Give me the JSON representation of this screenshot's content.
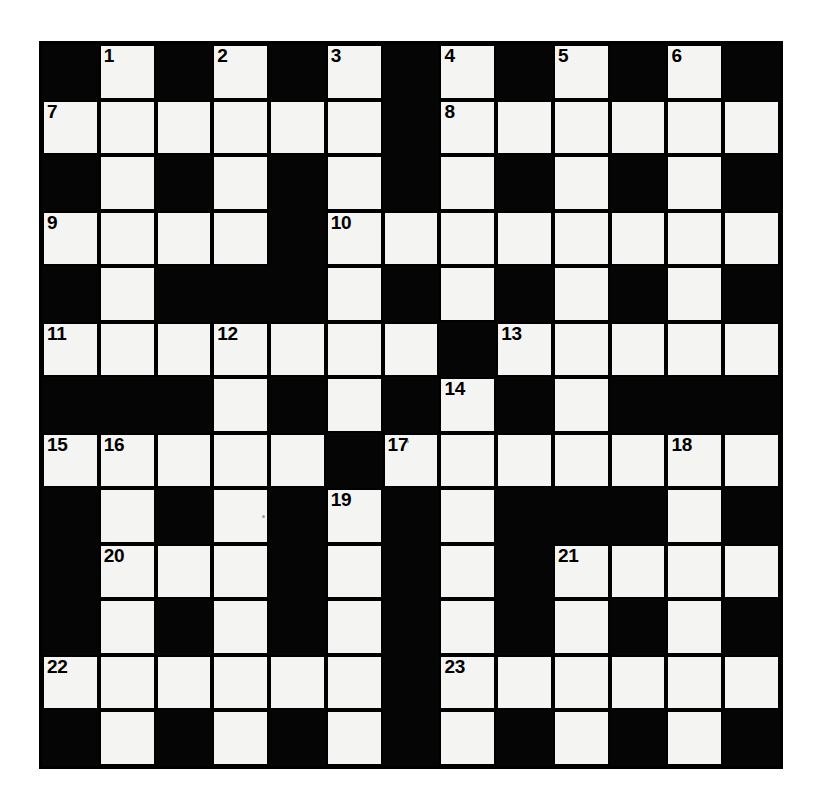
{
  "puzzle": {
    "type": "crossword-grid",
    "title": "Crossword Puzzle Grid",
    "rows": 13,
    "columns": 13,
    "colors": {
      "block": "#050505",
      "cell": "#f4f4f2",
      "border": "#000000",
      "number": "#000000",
      "page": "#ffffff"
    },
    "grid": [
      [
        "block",
        "white",
        "block",
        "white",
        "block",
        "white",
        "block",
        "white",
        "block",
        "white",
        "block",
        "white",
        "block"
      ],
      [
        "white",
        "white",
        "white",
        "white",
        "white",
        "white",
        "block",
        "white",
        "white",
        "white",
        "white",
        "white",
        "white"
      ],
      [
        "block",
        "white",
        "block",
        "white",
        "block",
        "white",
        "block",
        "white",
        "block",
        "white",
        "block",
        "white",
        "block"
      ],
      [
        "white",
        "white",
        "white",
        "white",
        "block",
        "white",
        "white",
        "white",
        "white",
        "white",
        "white",
        "white",
        "white"
      ],
      [
        "block",
        "white",
        "block",
        "block",
        "block",
        "white",
        "block",
        "white",
        "block",
        "white",
        "block",
        "white",
        "block"
      ],
      [
        "white",
        "white",
        "white",
        "white",
        "white",
        "white",
        "white",
        "block",
        "white",
        "white",
        "white",
        "white",
        "white"
      ],
      [
        "block",
        "block",
        "block",
        "white",
        "block",
        "white",
        "block",
        "white",
        "block",
        "white",
        "block",
        "block",
        "block"
      ],
      [
        "white",
        "white",
        "white",
        "white",
        "white",
        "block",
        "white",
        "white",
        "white",
        "white",
        "white",
        "white",
        "white"
      ],
      [
        "block",
        "white",
        "block",
        "white",
        "block",
        "white",
        "block",
        "white",
        "block",
        "block",
        "block",
        "white",
        "block"
      ],
      [
        "block",
        "white",
        "white",
        "white",
        "block",
        "white",
        "block",
        "white",
        "block",
        "white",
        "white",
        "white",
        "white"
      ],
      [
        "block",
        "white",
        "block",
        "white",
        "block",
        "white",
        "block",
        "white",
        "block",
        "white",
        "block",
        "white",
        "block"
      ],
      [
        "white",
        "white",
        "white",
        "white",
        "white",
        "white",
        "block",
        "white",
        "white",
        "white",
        "white",
        "white",
        "white"
      ],
      [
        "block",
        "white",
        "block",
        "white",
        "block",
        "white",
        "block",
        "white",
        "block",
        "white",
        "block",
        "white",
        "block"
      ]
    ],
    "numbers": [
      {
        "n": "1",
        "row": 0,
        "col": 1
      },
      {
        "n": "2",
        "row": 0,
        "col": 3
      },
      {
        "n": "3",
        "row": 0,
        "col": 5
      },
      {
        "n": "4",
        "row": 0,
        "col": 7
      },
      {
        "n": "5",
        "row": 0,
        "col": 9
      },
      {
        "n": "6",
        "row": 0,
        "col": 11
      },
      {
        "n": "7",
        "row": 1,
        "col": 0
      },
      {
        "n": "8",
        "row": 1,
        "col": 7
      },
      {
        "n": "9",
        "row": 3,
        "col": 0
      },
      {
        "n": "10",
        "row": 3,
        "col": 5
      },
      {
        "n": "11",
        "row": 5,
        "col": 0
      },
      {
        "n": "12",
        "row": 5,
        "col": 3
      },
      {
        "n": "13",
        "row": 5,
        "col": 8
      },
      {
        "n": "14",
        "row": 6,
        "col": 7
      },
      {
        "n": "15",
        "row": 7,
        "col": 0
      },
      {
        "n": "16",
        "row": 7,
        "col": 1
      },
      {
        "n": "17",
        "row": 7,
        "col": 6
      },
      {
        "n": "18",
        "row": 7,
        "col": 11
      },
      {
        "n": "19",
        "row": 8,
        "col": 5
      },
      {
        "n": "20",
        "row": 9,
        "col": 1
      },
      {
        "n": "21",
        "row": 9,
        "col": 9
      },
      {
        "n": "22",
        "row": 11,
        "col": 0
      },
      {
        "n": "23",
        "row": 11,
        "col": 7
      }
    ]
  }
}
